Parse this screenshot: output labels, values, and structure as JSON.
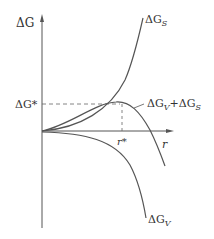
{
  "diagram": {
    "y_axis_label": "ΔG",
    "x_axis_label": "r",
    "critical_energy_label": "ΔG*",
    "critical_radius_label": "r*",
    "curves": [
      {
        "name": "surface",
        "label": "ΔG_S",
        "display": "ΔGS"
      },
      {
        "name": "sum",
        "label": "ΔG_V + ΔG_S",
        "display": "ΔGV+ΔGS"
      },
      {
        "name": "volume",
        "label": "ΔG_V",
        "display": "ΔGV"
      }
    ],
    "colors": {
      "line": "#555555",
      "text": "#333333"
    }
  }
}
